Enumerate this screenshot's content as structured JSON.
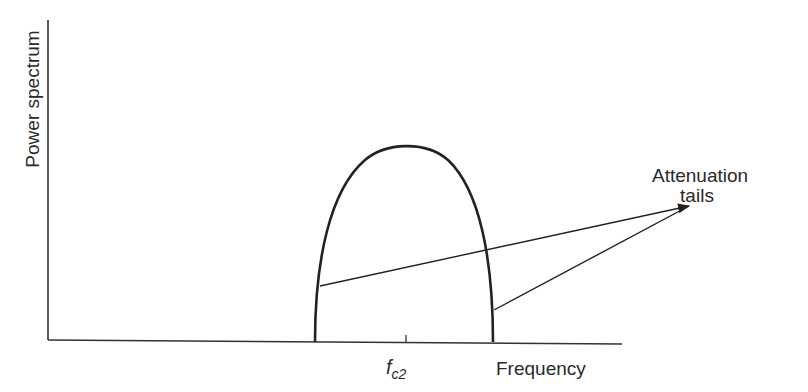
{
  "diagram": {
    "y_axis_label": "Power spectrum",
    "x_axis_label": "Frequency",
    "tick_label_base": "f",
    "tick_label_sub": "c2",
    "annotation_line1": "Attenuation",
    "annotation_line2": "tails",
    "colors": {
      "stroke": "#222222",
      "background": "#ffffff"
    }
  }
}
